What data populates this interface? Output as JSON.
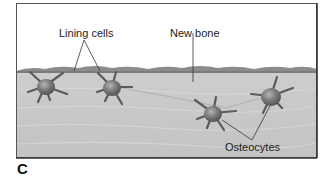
{
  "figure": {
    "panel_letter": "C",
    "labels": {
      "lining_cells": "Lining cells",
      "new_bone": "New bone",
      "osteocytes": "Osteocytes"
    },
    "colors": {
      "frame": "#555555",
      "sky": "#ffffff",
      "bone_matrix": "#c9c9c9",
      "new_bone_surface": "#8a8a8a",
      "cell_body": "#6e6e6e",
      "leader_line": "#333333"
    }
  }
}
